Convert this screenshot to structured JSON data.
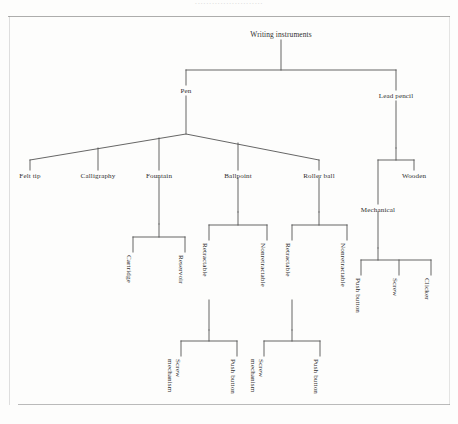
{
  "page": {
    "running_head": "........................",
    "background": "#fdfdfc",
    "rule_color": "#8e8e8e",
    "line_color": "#4a4a4a",
    "text_color": "#2f2f2f"
  },
  "diagram": {
    "type": "hierarchy-tree",
    "orientation": "top-down",
    "title": "Writing instruments",
    "nodes": {
      "root": "Writing instruments",
      "pen": "Pen",
      "lead_pencil": "Lead pencil",
      "felt_tip": "Felt tip",
      "calligraphy": "Calligraphy",
      "fountain": "Fountain",
      "ballpoint": "Ballpoint",
      "roller_ball": "Roller ball",
      "mechanical": "Mechanical",
      "wooden": "Wooden",
      "cartridge": "Cartridge",
      "reservoir": "Reservoir",
      "bp_retractable": "Retractable",
      "bp_nonretractable": "Nonretractable",
      "rb_retractable": "Retractable",
      "rb_nonretractable": "Nonretractable",
      "mech_push_button": "Push button",
      "mech_screw": "Screw",
      "mech_clicker": "Clicker",
      "bp_screw_mechanism_l1": "Screw",
      "bp_screw_mechanism_l2": "mechanism",
      "bp_push_button": "Push button",
      "rb_screw_mechanism_l1": "Screw",
      "rb_screw_mechanism_l2": "mechanism",
      "rb_push_button": "Push button"
    },
    "edges": [
      [
        "root",
        "pen"
      ],
      [
        "root",
        "lead_pencil"
      ],
      [
        "pen",
        "felt_tip"
      ],
      [
        "pen",
        "calligraphy"
      ],
      [
        "pen",
        "fountain"
      ],
      [
        "pen",
        "ballpoint"
      ],
      [
        "pen",
        "roller_ball"
      ],
      [
        "lead_pencil",
        "mechanical"
      ],
      [
        "lead_pencil",
        "wooden"
      ],
      [
        "fountain",
        "cartridge"
      ],
      [
        "fountain",
        "reservoir"
      ],
      [
        "ballpoint",
        "bp_retractable"
      ],
      [
        "ballpoint",
        "bp_nonretractable"
      ],
      [
        "roller_ball",
        "rb_retractable"
      ],
      [
        "roller_ball",
        "rb_nonretractable"
      ],
      [
        "mechanical",
        "mech_push_button"
      ],
      [
        "mechanical",
        "mech_screw"
      ],
      [
        "mechanical",
        "mech_clicker"
      ],
      [
        "bp_retractable",
        "bp_screw_mechanism_l1"
      ],
      [
        "bp_retractable",
        "bp_push_button"
      ],
      [
        "rb_retractable",
        "rb_screw_mechanism_l1"
      ],
      [
        "rb_retractable",
        "rb_push_button"
      ]
    ]
  }
}
